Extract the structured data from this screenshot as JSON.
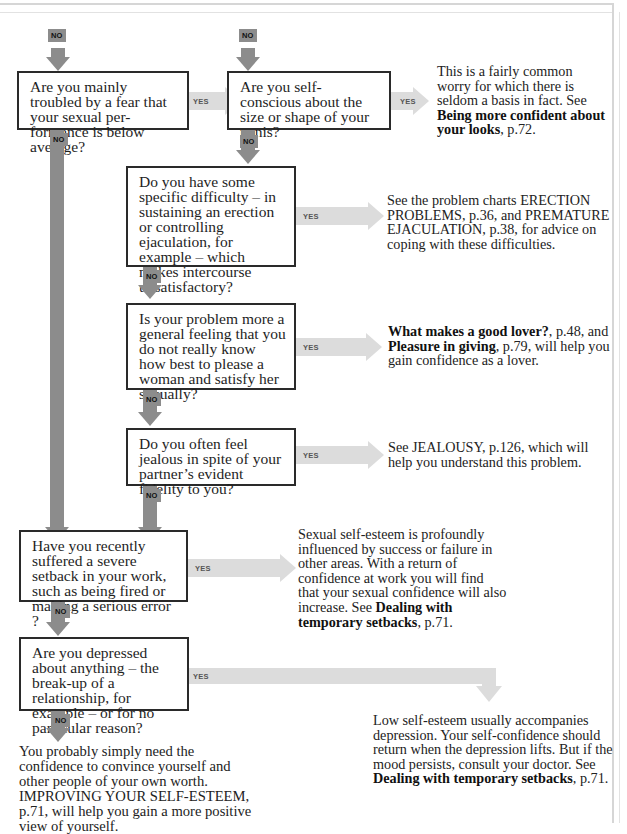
{
  "labels": {
    "yes": "YES",
    "no": "NO"
  },
  "colors": {
    "no_arrow": "#8c8c8c",
    "yes_arrow": "#dcdcdc",
    "box_border": "#2a2a2a"
  },
  "questions": [
    {
      "id": "q1",
      "text": "Are you mainly troubled by a fear that your sexual per-formance is below average?"
    },
    {
      "id": "q2",
      "text": "Are you self-conscious about the size or shape of your penis?"
    },
    {
      "id": "q3",
      "text": "Do you have some specific difficulty – in sustaining an erection or controlling ejaculation, for example – which makes intercourse unsatisfactory?"
    },
    {
      "id": "q4",
      "text": "Is your problem more a general feeling that you do not really know how best to please a woman and satisfy her sexually?"
    },
    {
      "id": "q5",
      "text": "Do you often feel jealous in spite of your partner’s evident fidelity to you?"
    },
    {
      "id": "q6",
      "text": "Have you recently suffered a severe setback in your work, such as being fired or making a serious error ?"
    },
    {
      "id": "q7",
      "text": "Are you depressed about anything – the break-up of a relationship, for example – or for no particular reason?"
    }
  ],
  "answers": {
    "a2": {
      "pre": "This is a fairly common worry for which there is seldom a basis in fact. See ",
      "bold": "Being more confident about your looks",
      "post": ", p.72."
    },
    "a3": {
      "text": "See the problem charts ERECTION PROBLEMS, p.36, and PREMATURE EJACULATION, p.38, for advice on coping with these difficulties."
    },
    "a4": {
      "bold1": "What makes a good lover?",
      "mid1": ", p.48, and ",
      "bold2": "Pleasure in giving",
      "post": ", p.79, will help you gain confidence as a lover."
    },
    "a5": {
      "text": "See JEALOUSY, p.126, which will help you understand this problem."
    },
    "a6": {
      "pre": "Sexual self-esteem is profoundly influenced by success or failure in other areas. With a return of confidence at work you will find that your sexual confidence will also increase. See ",
      "bold": "Dealing with temporary setbacks",
      "post": ", p.71."
    },
    "a7": {
      "pre": "Low self-esteem usually accompanies depression. Your self-confidence should return when the depression lifts. But if the mood persists, consult your doctor. See ",
      "bold": "Dealing with temporary setbacks",
      "post": ", p.71."
    },
    "final": {
      "text": "You probably simply need the confidence to convince yourself and other people of your own worth. IMPROVING YOUR SELF-ESTEEM, p.71, will help you gain a more positive view of yourself."
    }
  }
}
